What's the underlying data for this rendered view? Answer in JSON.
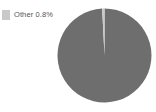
{
  "chart_data": {
    "type": "pie",
    "title": "",
    "subtitle": "",
    "xlabel": "",
    "ylabel": "",
    "grid": false,
    "legend_position": "top-left",
    "start_angle_deg": -90,
    "direction": "clockwise",
    "categories": [
      "Main",
      "Other"
    ],
    "values": [
      99.2,
      0.8
    ],
    "labels": [
      "",
      "Other 0.8%"
    ],
    "colors": [
      "#6e6e6e",
      "#c9c9c9"
    ],
    "slices": [
      {
        "name": "Main",
        "value": 99.2,
        "percent_label": "",
        "color": "#6e6e6e",
        "in_legend": false
      },
      {
        "name": "Other",
        "value": 0.8,
        "percent_label": "0.8%",
        "color": "#c9c9c9",
        "in_legend": true
      }
    ],
    "geometry": {
      "center_x": 47.5,
      "center_y": 47.5,
      "radius": 47.0
    }
  },
  "legend": {
    "items": [
      {
        "label": "Other 0.8%",
        "color": "#c9c9c9"
      }
    ]
  },
  "colors": {
    "background": "#ffffff",
    "main_slice": "#6e6e6e",
    "other_slice": "#c9c9c9",
    "legend_text": "#555555"
  }
}
